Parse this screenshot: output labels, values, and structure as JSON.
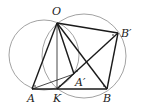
{
  "diagram": {
    "type": "geometry",
    "colors": {
      "line": "#1a1a1a",
      "circle": "#8a8a8a",
      "background": "#ffffff"
    },
    "points": [
      {
        "id": "O",
        "label": "O",
        "x": 57,
        "y": 23,
        "lx": 52,
        "ly": 15
      },
      {
        "id": "Bp",
        "label": "B′",
        "x": 118,
        "y": 33,
        "lx": 121,
        "ly": 37
      },
      {
        "id": "A",
        "label": "A",
        "x": 32,
        "y": 89,
        "lx": 27,
        "ly": 102
      },
      {
        "id": "K",
        "label": "K",
        "x": 57,
        "y": 89,
        "lx": 53,
        "ly": 102
      },
      {
        "id": "B",
        "label": "B",
        "x": 107,
        "y": 89,
        "lx": 103,
        "ly": 102
      },
      {
        "id": "Ap",
        "label": "A′",
        "x": 74,
        "y": 74,
        "lx": 75,
        "ly": 86
      }
    ],
    "circles": [
      {
        "name": "left-circle",
        "cx": 44,
        "cy": 55,
        "r": 35
      },
      {
        "name": "right-circle",
        "cx": 84,
        "cy": 56,
        "r": 42
      }
    ],
    "segments": [
      [
        "O",
        "A"
      ],
      [
        "O",
        "K"
      ],
      [
        "O",
        "Ap"
      ],
      [
        "O",
        "B"
      ],
      [
        "O",
        "Bp"
      ],
      [
        "A",
        "B"
      ],
      [
        "A",
        "Ap"
      ],
      [
        "K",
        "Bp"
      ],
      [
        "B",
        "Bp"
      ]
    ]
  }
}
